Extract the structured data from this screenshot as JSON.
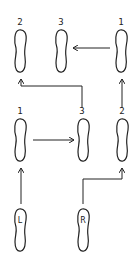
{
  "diagram": {
    "type": "dance-step footprint diagram",
    "stroke_color": "#222222",
    "background": "#ffffff",
    "start_feet": [
      {
        "id": "L",
        "label": "L"
      },
      {
        "id": "R",
        "label": "R"
      }
    ],
    "middle_row": [
      {
        "id": "mid-1",
        "step": "1"
      },
      {
        "id": "mid-3",
        "step": "3"
      },
      {
        "id": "mid-2",
        "step": "2"
      }
    ],
    "top_row": [
      {
        "id": "top-2",
        "step": "2"
      },
      {
        "id": "top-3",
        "step": "3"
      },
      {
        "id": "top-1",
        "step": "1"
      }
    ],
    "arrows": [
      {
        "from": "L",
        "to": "mid-1",
        "direction": "up"
      },
      {
        "from": "R",
        "to": "mid-2",
        "direction": "up-right-up"
      },
      {
        "from": "mid-1",
        "to": "mid-3",
        "direction": "right"
      },
      {
        "from": "mid-2",
        "to": "top-1",
        "direction": "up"
      },
      {
        "from": "mid-3",
        "to": "top-2",
        "direction": "up-left-up"
      },
      {
        "from": "top-1",
        "to": "top-3",
        "direction": "left"
      }
    ]
  }
}
